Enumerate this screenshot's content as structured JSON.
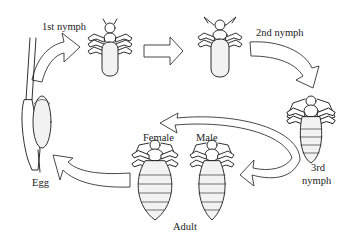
{
  "diagram": {
    "type": "life-cycle",
    "stages": [
      {
        "id": "egg",
        "label": "Egg"
      },
      {
        "id": "nymph1",
        "label": "1st nymph"
      },
      {
        "id": "nymph2",
        "label": "2nd nymph"
      },
      {
        "id": "nymph3",
        "label": "3rd\nnymph",
        "label_line1": "3rd",
        "label_line2": "nymph"
      },
      {
        "id": "adult",
        "label": "Adult",
        "forms": [
          {
            "id": "female",
            "label": "Female"
          },
          {
            "id": "male",
            "label": "Male"
          }
        ]
      }
    ],
    "arrows": [
      {
        "from": "egg",
        "to": "nymph1"
      },
      {
        "from": "nymph1",
        "to": "nymph2"
      },
      {
        "from": "nymph2",
        "to": "nymph3"
      },
      {
        "from": "nymph3",
        "to": "adult"
      },
      {
        "from": "adult",
        "to": "egg"
      }
    ],
    "colors": {
      "line": "#1a1a1a",
      "fill": "#ffffff",
      "background": "#ffffff"
    }
  },
  "labels": {
    "nymph1": "1st nymph",
    "nymph2": "2nd nymph",
    "nymph3_line1": "3rd",
    "nymph3_line2": "nymph",
    "female": "Female",
    "male": "Male",
    "adult": "Adult",
    "egg": "Egg"
  }
}
